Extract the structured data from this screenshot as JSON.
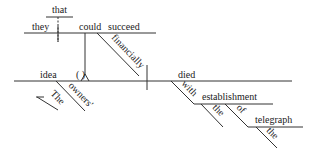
{
  "diagram": {
    "type": "sentence-diagram",
    "sentence_parts": {
      "clause_that": "that",
      "clause_subject": "they",
      "clause_aux": "could",
      "clause_verb": "succeed",
      "clause_adverb": "financially",
      "subject": "idea",
      "appositive_parens": "(   )",
      "possessive": "owners'",
      "article_subject": "The",
      "verb": "died",
      "preposition_1": "with",
      "object_1": "establishment",
      "article_object_1": "the",
      "preposition_2": "of",
      "object_2": "telegraph",
      "article_object_2": "the"
    }
  }
}
